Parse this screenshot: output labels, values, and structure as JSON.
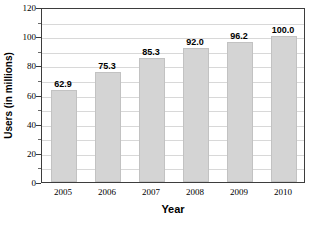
{
  "chart_data": {
    "type": "bar",
    "title": "",
    "xlabel": "Year",
    "ylabel": "Users (in millions)",
    "categories": [
      "2005",
      "2006",
      "2007",
      "2008",
      "2009",
      "2010"
    ],
    "values": [
      62.9,
      75.3,
      85.3,
      92.0,
      96.2,
      100.0
    ],
    "value_labels": [
      "62.9",
      "75.3",
      "85.3",
      "92.0",
      "96.2",
      "100.0"
    ],
    "ylim": [
      0,
      120
    ],
    "y_major_ticks": [
      0,
      20,
      40,
      60,
      80,
      100,
      120
    ],
    "y_major_tick_labels": [
      "0",
      "20",
      "40",
      "60",
      "80",
      "100",
      "120"
    ],
    "y_minor_ticks": [
      10,
      30,
      50,
      70,
      90,
      110
    ],
    "gridlines": [
      10,
      20,
      30,
      40,
      50,
      60,
      70,
      80,
      90,
      100,
      110
    ],
    "grid": true,
    "legend": false,
    "legend_position": "none",
    "bar_color": "#d4d4d4",
    "bar_border_color": "#c2c2c2",
    "grid_color": "#d8d8d8",
    "axis_color": "#3d3d3d",
    "background_color": "#ffffff",
    "text_color": "#000000"
  }
}
